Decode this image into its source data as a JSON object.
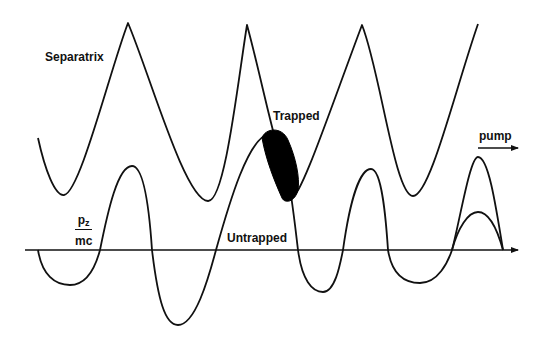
{
  "figure": {
    "labels": {
      "separatrix": "Separatrix",
      "trapped": "Trapped",
      "untrapped": "Untrapped",
      "pz_numerator": "p",
      "pz_subscript": "z",
      "pz_denominator": "mc",
      "pump": "pump"
    },
    "colors": {
      "stroke": "#111111",
      "background": "#ffffff",
      "trapped_fill": "#000000"
    },
    "curves": {
      "separatrix": "M38,138 C45,170 55,196 64,195 C80,193 110,70 128,23 C150,75 185,200 208,201 C225,202 238,80 247,25 C262,80 275,150 292,196 C300,200 330,110 362,25 C380,70 395,196 413,196 C430,196 455,90 478,24",
      "momentum": "M38,250 C42,275 55,285 70,285 C88,285 96,265 100,250 C108,210 118,166 132,166 C145,166 150,220 152,250 C158,300 165,325 178,325 C195,325 208,280 216,250 C230,200 248,140 268,134 C285,130 292,200 298,250 C302,280 312,292 323,292 C335,292 340,265 343,250 C350,200 360,169 371,169 C382,169 386,220 388,250 C392,275 405,283 420,283 C438,283 448,262 452,250 C460,220 470,157 478,157 C488,157 495,200 503,250",
      "momentum_inner": "M452,250 C458,228 468,212 478,212 C490,212 498,232 503,250",
      "trapped_blob": "M262,138 C265,128 282,126 288,140 C296,158 300,178 298,190 C295,202 285,204 282,198 C274,180 266,160 262,138 Z",
      "axis": {
        "x1": 25,
        "y1": 250,
        "x2": 518,
        "y2": 250
      },
      "pump_arrow": {
        "x1": 478,
        "y1": 148,
        "x2": 518,
        "y2": 148
      }
    }
  }
}
